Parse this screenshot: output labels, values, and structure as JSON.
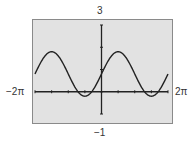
{
  "chart_data": {
    "type": "line",
    "title": "",
    "xlabel": "",
    "ylabel": "",
    "function_approx": "y ≈ 0.8 + sin(x)",
    "xlim": [
      -6.2832,
      6.2832
    ],
    "ylim": [
      -1,
      3
    ],
    "x_tick_spacing": "π/2",
    "y_tick_spacing": 1,
    "window_labels": {
      "ymax": "3",
      "ymin": "−1",
      "xmin": "−2π",
      "xmax": "2π"
    },
    "series": [
      {
        "name": "curve",
        "x": [
          -6.2832,
          -5.4978,
          -4.7124,
          -3.927,
          -3.1416,
          -2.3562,
          -1.5708,
          -0.7854,
          0,
          0.7854,
          1.5708,
          2.3562,
          3.1416,
          3.927,
          4.7124,
          5.4978,
          6.2832
        ],
        "values": [
          0.8,
          1.51,
          1.8,
          1.51,
          0.8,
          0.09,
          -0.2,
          0.09,
          0.8,
          1.51,
          1.8,
          1.51,
          0.8,
          0.09,
          -0.2,
          0.09,
          0.8
        ]
      }
    ],
    "grid": false,
    "legend": null
  },
  "colors": {
    "plot_bg": "#e2e2e2",
    "plot_border": "#8a8a8a",
    "curve": "#222222",
    "axis": "#222222"
  }
}
